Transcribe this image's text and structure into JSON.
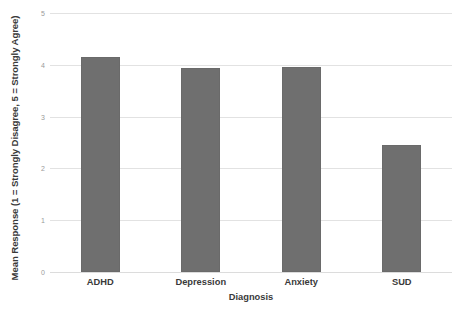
{
  "chart_data": {
    "type": "bar",
    "title": "",
    "subtitle": "",
    "categories": [
      "ADHD",
      "Depression",
      "Anxiety",
      "SUD"
    ],
    "values": [
      4.15,
      3.93,
      3.95,
      2.45
    ],
    "xlabel": "Diagnosis",
    "ylabel": "Mean Response (1 = Strongly Disagree, 5 = Strongly Agree)",
    "ylim": [
      0,
      5
    ],
    "ytick_labels": [
      "5",
      "4",
      "3",
      "2",
      "1",
      "0"
    ],
    "ytick_values": [
      5,
      4,
      3,
      2,
      1,
      0
    ],
    "grid": true,
    "legend": false,
    "legend_position": "none",
    "bar_color": "#6f6f6f",
    "grid_color": "#e2e2e2",
    "background_color": "#ffffff",
    "text_color": "#3a3a3a",
    "tick_text_color": "#9a9a9a"
  }
}
